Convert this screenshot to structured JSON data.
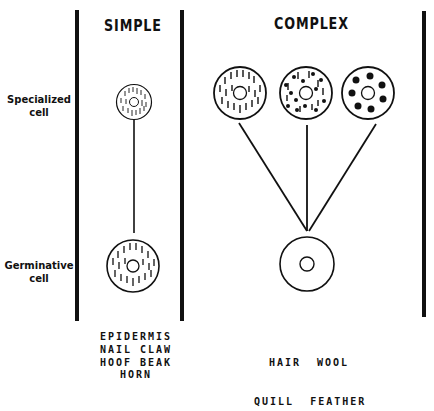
{
  "diagram": {
    "columns": [
      {
        "heading": "SIMPLE"
      },
      {
        "heading": "COMPLEX"
      }
    ],
    "row_labels": {
      "specialized": [
        "Specialized",
        "cell"
      ],
      "germinative": [
        "Germinative",
        "cell"
      ]
    },
    "captions": {
      "simple": [
        "EPIDERMIS",
        "NAIL CLAW",
        "HOOF BEAK",
        "HORN"
      ],
      "complex": [
        "HAIR  WOOL",
        "QUILL  FEATHER"
      ]
    },
    "cells": {
      "simple_specialized": "striated-cell-small",
      "simple_germinative": "striated-cell",
      "complex_specialized": [
        "striated-cell",
        "striated-granular-cell",
        "granular-cell"
      ],
      "complex_germinative": "plain-cell"
    },
    "colors": {
      "ink": "#111111",
      "background": "#ffffff"
    }
  }
}
